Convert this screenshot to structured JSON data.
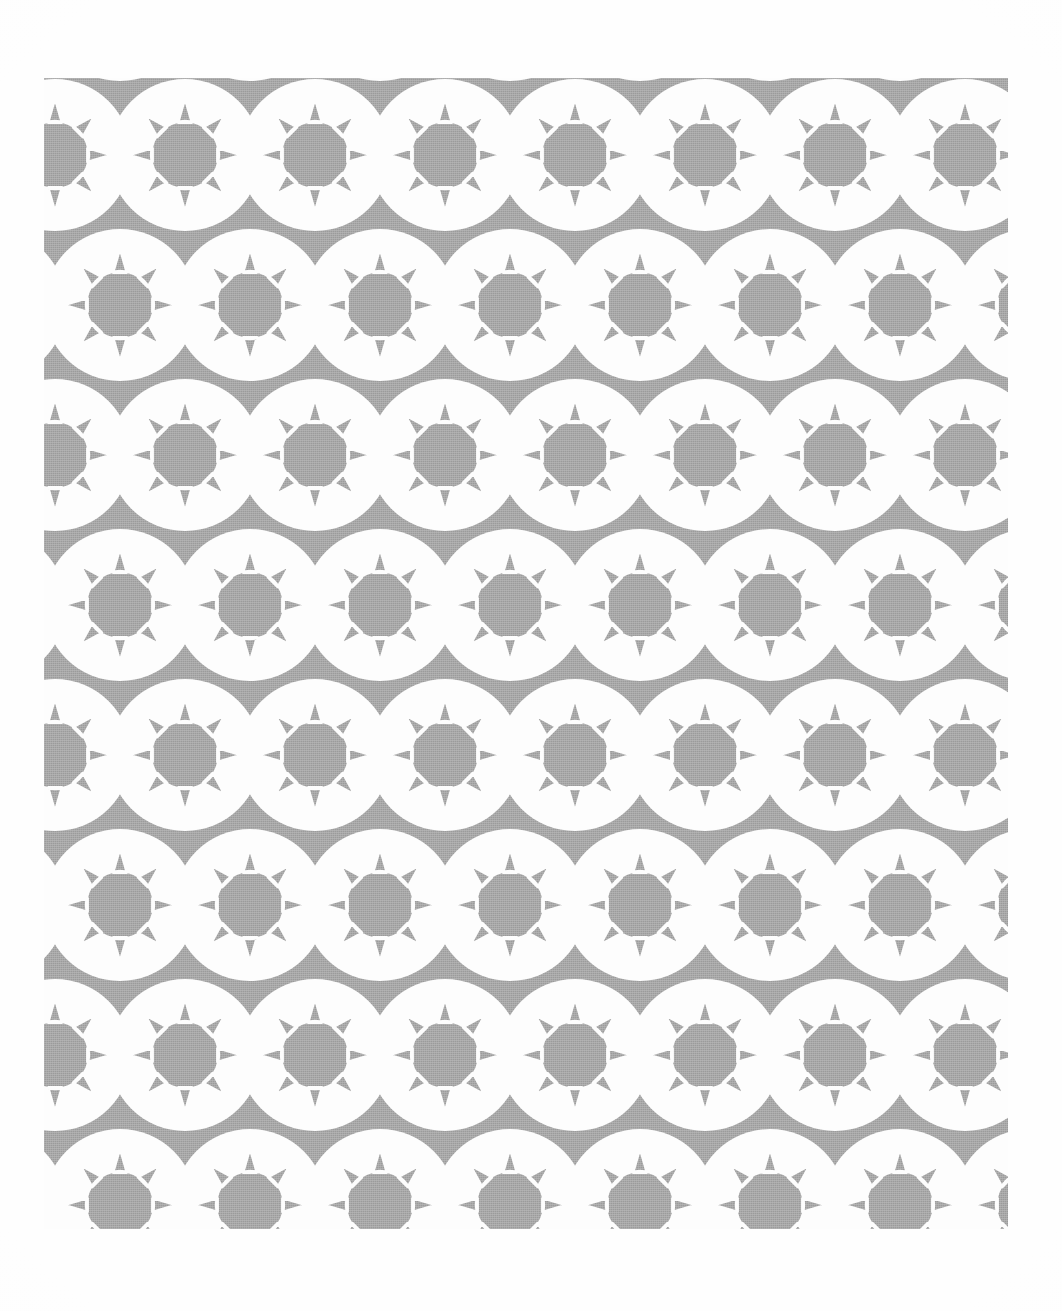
{
  "image": {
    "kind": "scanned-textile-pattern",
    "caption": "Repeating rosette / sunburst pattern printed in flat grey halftone on white paper",
    "canvas_width": 1062,
    "canvas_height": 1311
  },
  "colors": {
    "paper": "#fefefe",
    "background": "#ffffff",
    "ink_grey": "#9b9b9b",
    "ink_grey_light": "#a6a6a6",
    "negative_white": "#fdfdfd"
  },
  "pattern": {
    "name": "eight-point-rosette-brick-repeat",
    "block_left": 44,
    "block_top": 78,
    "block_width": 964,
    "block_height": 1151,
    "period_x": 130,
    "period_y": 150,
    "row_offset_x": 65,
    "columns": 9,
    "rows": 9,
    "first_center_x": 185,
    "first_center_y": 155,
    "motif": {
      "name": "sun-rosette",
      "disc_radius": 34,
      "spike_outer_radius": 56,
      "spike_half_angle_deg": 12,
      "spike_count": 8,
      "spike_start_angle_deg": -90,
      "ring_inner_radius": 60,
      "ring_outer_radius": 76,
      "ring_fill": "#fdfdfd",
      "disc_fill": "#9b9b9b",
      "spike_fill": "#9b9b9b",
      "field_fill": "#9b9b9b",
      "gap_stroke": "#fdfdfd",
      "gap_stroke_width": 2.4
    }
  },
  "labels": {
    "pattern_region": "printed pattern region",
    "paper_region": "scanned paper background",
    "motif": "eight-point sun rosette motif",
    "texture": "halftone dither texture"
  },
  "chart_data": {
    "type": "heatmap",
    "xlabel": "",
    "ylabel": "",
    "categories": [
      "row 1",
      "row 2",
      "row 3",
      "row 4",
      "row 5",
      "row 6",
      "row 7",
      "row 8",
      "row 9"
    ],
    "values": [
      9,
      9,
      9,
      9,
      9,
      9,
      9,
      9,
      9
    ]
  }
}
